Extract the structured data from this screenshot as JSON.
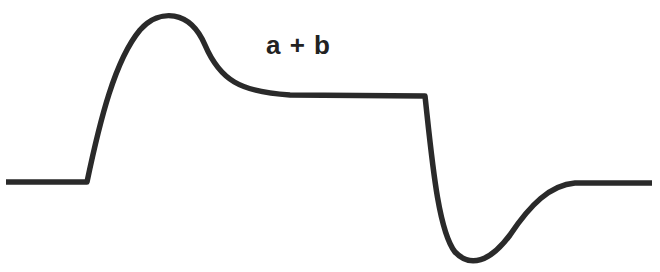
{
  "diagram": {
    "label": "a + b",
    "stroke_color": "#2a2a2a",
    "background": "#ffffff",
    "waveform": {
      "description": "Response curve: baseline, overshoot peak, plateau, sharp drop with undershoot, recovery to baseline",
      "segments": [
        {
          "name": "baseline-left",
          "from": [
            6,
            182
          ],
          "to": [
            87,
            182
          ]
        },
        {
          "name": "rise-overshoot",
          "peak": [
            168,
            15
          ]
        },
        {
          "name": "plateau",
          "from": [
            270,
            95
          ],
          "to": [
            425,
            96
          ]
        },
        {
          "name": "drop-undershoot",
          "trough": [
            473,
            260
          ]
        },
        {
          "name": "baseline-right",
          "from": [
            575,
            183
          ],
          "to": [
            652,
            183
          ]
        }
      ]
    }
  }
}
